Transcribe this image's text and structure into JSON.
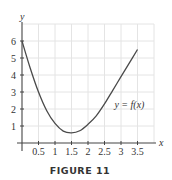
{
  "chart_data": {
    "type": "line",
    "title": "",
    "caption": "FIGURE 11",
    "xlabel": "x",
    "ylabel": "y",
    "xlim": [
      0,
      4
    ],
    "ylim": [
      0,
      7
    ],
    "grid": true,
    "x_ticks": [
      0.5,
      1,
      1.5,
      2,
      2.5,
      3,
      3.5
    ],
    "x_tick_labels": [
      "0.5",
      "1",
      "1.5",
      "2",
      "2.5",
      "3",
      "3.5"
    ],
    "y_ticks": [
      1,
      2,
      3,
      4,
      5,
      6
    ],
    "y_tick_labels": [
      "1",
      "2",
      "3",
      "4",
      "5",
      "6"
    ],
    "series": [
      {
        "name": "y = f(x)",
        "label": "y = f(x)",
        "x": [
          0,
          0.25,
          0.5,
          0.75,
          1.0,
          1.25,
          1.5,
          1.75,
          2.0,
          2.25,
          2.5,
          2.75,
          3.0,
          3.25,
          3.5
        ],
        "y": [
          6.0,
          4.4,
          3.0,
          1.9,
          1.15,
          0.7,
          0.6,
          0.72,
          1.1,
          1.6,
          2.3,
          3.1,
          3.9,
          4.7,
          5.5
        ]
      }
    ]
  }
}
